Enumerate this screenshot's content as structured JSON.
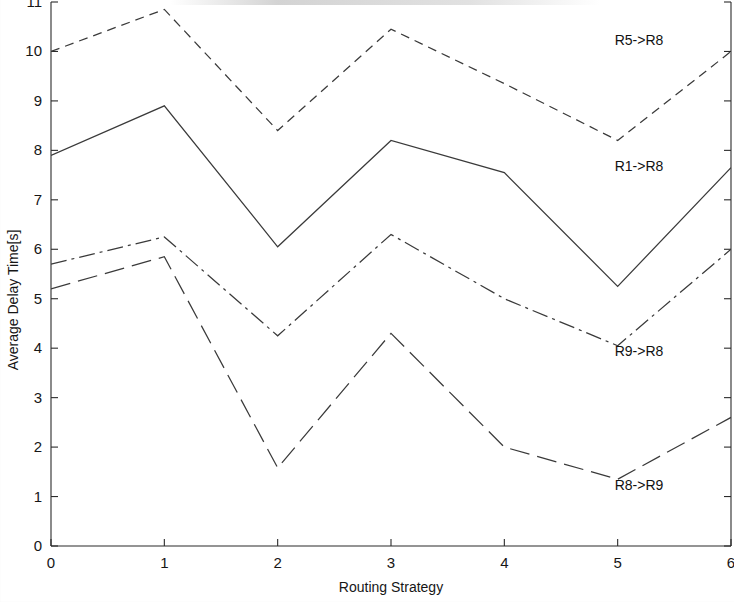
{
  "chart_data": {
    "type": "line",
    "title": "",
    "xlabel": "Routing Strategy",
    "ylabel": "Average Delay Time[s]",
    "xlim": [
      0,
      6
    ],
    "ylim": [
      0,
      11
    ],
    "xticks": [
      0,
      1,
      2,
      3,
      4,
      5,
      6
    ],
    "yticks": [
      0,
      1,
      2,
      3,
      4,
      5,
      6,
      7,
      8,
      9,
      10,
      11
    ],
    "xticklabels": [
      "0",
      "1",
      "2",
      "3",
      "4",
      "5",
      "6"
    ],
    "yticklabels": [
      "0",
      "1",
      "2",
      "3",
      "4",
      "5",
      "6",
      "7",
      "8",
      "9",
      "10",
      "11"
    ],
    "grid": false,
    "legend": "inline-labels-right",
    "x": [
      0,
      1,
      2,
      3,
      4,
      5,
      6
    ],
    "series": [
      {
        "name": "R5->R8",
        "label": "R5->R8",
        "dash": "short-dash",
        "values": [
          10.0,
          10.85,
          8.4,
          10.45,
          9.35,
          8.2,
          10.0
        ]
      },
      {
        "name": "R1->R8",
        "label": "R1->R8",
        "dash": "fine-dot",
        "values": [
          7.9,
          8.9,
          6.05,
          8.2,
          7.55,
          5.25,
          7.65
        ]
      },
      {
        "name": "R9->R8",
        "label": "R9->R8",
        "dash": "dash-dot",
        "values": [
          5.7,
          6.25,
          4.25,
          6.3,
          5.0,
          4.05,
          6.0
        ]
      },
      {
        "name": "R8->R9",
        "label": "R8->R9",
        "dash": "long-dash",
        "values": [
          5.2,
          5.85,
          1.58,
          4.3,
          2.0,
          1.35,
          2.6
        ]
      }
    ],
    "annotations": [
      {
        "text": "R5->R8",
        "x_px": 639,
        "y_px": 45
      },
      {
        "text": "R1->R8",
        "x_px": 639,
        "y_px": 171
      },
      {
        "text": "R9->R8",
        "x_px": 639,
        "y_px": 356
      },
      {
        "text": "R8->R9",
        "x_px": 639,
        "y_px": 490
      }
    ],
    "colors": {
      "line": "#3a3a3a",
      "axis": "#2b2b2b",
      "text": "#161616",
      "background": "#ffffff"
    }
  }
}
